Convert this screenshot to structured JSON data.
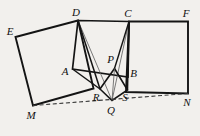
{
  "figure": {
    "kind": "geometry-diagram",
    "canvas": {
      "width": 200,
      "height": 136
    },
    "background_color": "#f2f0ed",
    "stroke_color": "#141414",
    "thin_stroke_color": "#4a4a4a",
    "dashed_stroke_color": "#3a3a3a"
  },
  "points": [
    {
      "id": "E",
      "label": "E",
      "x": 15.5,
      "y": 37.0,
      "label_x": 10.0,
      "label_y": 31.0
    },
    {
      "id": "D",
      "label": "D",
      "x": 78.0,
      "y": 20.5,
      "label_x": 76.0,
      "label_y": 12.0
    },
    {
      "id": "C",
      "label": "C",
      "x": 129.0,
      "y": 21.5,
      "label_x": 128.0,
      "label_y": 13.0
    },
    {
      "id": "F",
      "label": "F",
      "x": 188.0,
      "y": 21.5,
      "label_x": 186.0,
      "label_y": 13.0
    },
    {
      "id": "A",
      "label": "A",
      "x": 72.5,
      "y": 69.0,
      "label_x": 65.0,
      "label_y": 70.5
    },
    {
      "id": "B",
      "label": "B",
      "x": 128.0,
      "y": 77.0,
      "label_x": 133.5,
      "label_y": 73.0
    },
    {
      "id": "P",
      "label": "P",
      "x": 114.5,
      "y": 68.5,
      "label_x": 110.5,
      "label_y": 58.5
    },
    {
      "id": "R",
      "label": "R",
      "x": 100.0,
      "y": 89.0,
      "label_x": 96.0,
      "label_y": 97.0
    },
    {
      "id": "S",
      "label": "S",
      "x": 127.5,
      "y": 90.0,
      "label_x": 125.0,
      "label_y": 96.5
    },
    {
      "id": "Q",
      "label": "Q",
      "x": 112.0,
      "y": 100.5,
      "label_x": 111.0,
      "label_y": 110.0
    },
    {
      "id": "M",
      "label": "M",
      "x": 33.0,
      "y": 105.5,
      "label_x": 31.0,
      "label_y": 115.0
    },
    {
      "id": "N",
      "label": "N",
      "x": 188.0,
      "y": 93.5,
      "label_x": 187.0,
      "label_y": 101.5
    }
  ],
  "paths": {
    "left_quad": "M 15.5 37 L 78 20.5 L 93.5 88.5 L 33 105.5 Z",
    "right_quad": "M 129 21.5 L 188 21.5 L 188 93.5 L 126 92 Z",
    "square_abcd": "M 78 20.5 L 129 21.5 L 128 77 L 72.5 69 Z",
    "inner_quad_pqrs": "M 114.5 68.5 L 127.5 90 L 112 100.5 L 100 89 Z",
    "seg_D_Q": "M 78 20.5 L 112 100.5",
    "seg_D_R": "M 78 20.5 L 100 89",
    "seg_C_Q": "M 129 21.5 L 112 100.5",
    "seg_C_S": "M 129 21.5 L 127.5 90",
    "seg_P_Q": "M 114.5 68.5 L 112 100.5",
    "seg_A_side": "M 72.5 69 L 100 89",
    "seg_B_side": "M 128 77 L 127.5 90",
    "dashed_MN": "M 33 105.5 L 188 93.5"
  }
}
